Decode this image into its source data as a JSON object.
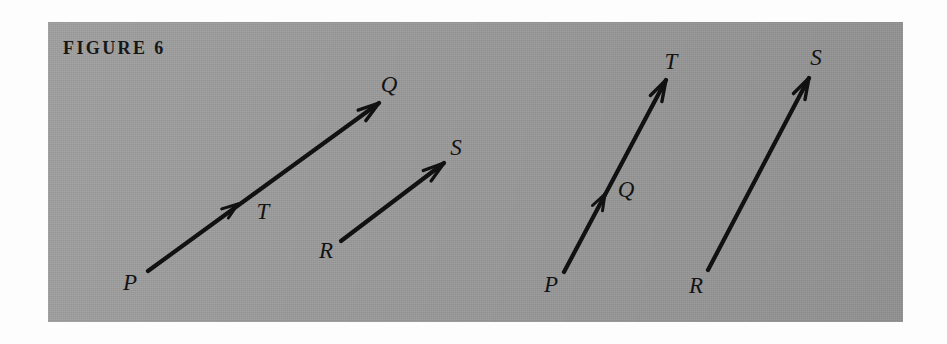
{
  "figure": {
    "caption": "FIGURE 6",
    "panel_color": "#9a9a9a",
    "page_color": "#fdfdfd",
    "ink_color": "#111111"
  },
  "diagram": {
    "type": "vector-arrow-diagram",
    "groups": [
      {
        "name": "left-group",
        "arrows": [
          {
            "name": "arrow-p-q",
            "from_label": "P",
            "to_label": "Q",
            "mid_label": "T",
            "start": {
              "x": 148,
              "y": 271
            },
            "end": {
              "x": 379,
              "y": 103
            },
            "mid_tick": {
              "x": 238,
              "y": 204
            }
          },
          {
            "name": "arrow-r-s",
            "from_label": "R",
            "to_label": "S",
            "mid_label": "",
            "start": {
              "x": 341,
              "y": 241
            },
            "end": {
              "x": 444,
              "y": 163
            },
            "mid_tick": null
          }
        ]
      },
      {
        "name": "right-group",
        "arrows": [
          {
            "name": "arrow-p-t",
            "from_label": "P",
            "to_label": "T",
            "mid_label": "Q",
            "start": {
              "x": 564,
              "y": 272
            },
            "end": {
              "x": 666,
              "y": 80
            },
            "mid_tick": {
              "x": 605,
              "y": 194
            }
          },
          {
            "name": "arrow-r-s-right",
            "from_label": "R",
            "to_label": "S",
            "mid_label": "",
            "start": {
              "x": 708,
              "y": 270
            },
            "end": {
              "x": 809,
              "y": 78
            },
            "mid_tick": null
          }
        ]
      }
    ],
    "labels": [
      {
        "name": "label-p-left",
        "text": "P",
        "x": 130,
        "y": 282
      },
      {
        "name": "label-t-left",
        "text": "T",
        "x": 263,
        "y": 211
      },
      {
        "name": "label-q-left",
        "text": "Q",
        "x": 389,
        "y": 84
      },
      {
        "name": "label-r-left",
        "text": "R",
        "x": 326,
        "y": 250
      },
      {
        "name": "label-s-left",
        "text": "S",
        "x": 456,
        "y": 147
      },
      {
        "name": "label-p-right",
        "text": "P",
        "x": 551,
        "y": 284
      },
      {
        "name": "label-q-right",
        "text": "Q",
        "x": 626,
        "y": 189
      },
      {
        "name": "label-t-right",
        "text": "T",
        "x": 671,
        "y": 61
      },
      {
        "name": "label-r-right",
        "text": "R",
        "x": 696,
        "y": 285
      },
      {
        "name": "label-s-right",
        "text": "S",
        "x": 816,
        "y": 57
      }
    ]
  }
}
